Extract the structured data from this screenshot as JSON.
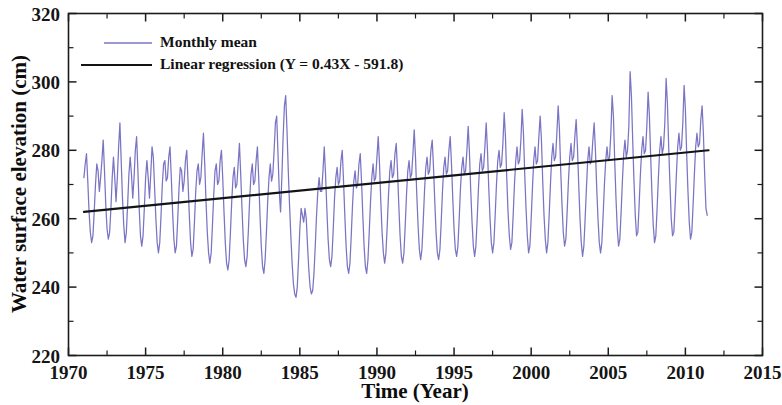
{
  "chart_data": {
    "type": "line",
    "title": "",
    "xlabel": "Time (Year)",
    "ylabel": "Water surface elevation (cm)",
    "xlim": [
      1970,
      2015
    ],
    "ylim": [
      220,
      320
    ],
    "x_major_ticks": [
      1970,
      1975,
      1980,
      1985,
      1990,
      1995,
      2000,
      2005,
      2010,
      2015
    ],
    "x_minor_interval": 2.5,
    "y_major_ticks": [
      220,
      240,
      260,
      280,
      300,
      320
    ],
    "y_minor_interval": 10,
    "grid": false,
    "legend_position": "top-left",
    "series": [
      {
        "name": "Monthly mean",
        "color": "#7a74c4",
        "style": "line",
        "x_start": 1971.0,
        "x_end": 2011.5,
        "x_step": 0.0833333,
        "values": [
          272,
          276,
          279,
          271,
          262,
          256,
          253,
          255,
          262,
          270,
          276,
          274,
          268,
          272,
          277,
          283,
          274,
          264,
          257,
          254,
          256,
          263,
          272,
          278,
          272,
          265,
          272,
          281,
          288,
          277,
          266,
          258,
          253,
          256,
          264,
          273,
          278,
          273,
          266,
          272,
          280,
          284,
          274,
          263,
          255,
          252,
          255,
          263,
          272,
          277,
          272,
          266,
          273,
          281,
          278,
          269,
          260,
          253,
          250,
          253,
          261,
          270,
          276,
          277,
          271,
          272,
          278,
          281,
          272,
          262,
          254,
          250,
          252,
          260,
          269,
          275,
          274,
          268,
          271,
          277,
          280,
          271,
          261,
          253,
          249,
          251,
          259,
          268,
          274,
          276,
          270,
          272,
          279,
          285,
          276,
          265,
          256,
          250,
          247,
          250,
          258,
          267,
          274,
          276,
          270,
          271,
          277,
          280,
          272,
          262,
          253,
          247,
          245,
          248,
          256,
          265,
          272,
          275,
          269,
          270,
          276,
          282,
          273,
          263,
          254,
          248,
          246,
          249,
          257,
          266,
          273,
          276,
          270,
          271,
          277,
          281,
          272,
          261,
          252,
          246,
          244,
          248,
          256,
          265,
          272,
          276,
          271,
          273,
          280,
          288,
          290,
          279,
          268,
          262,
          272,
          284,
          293,
          296,
          286,
          274,
          264,
          255,
          247,
          241,
          238,
          237,
          240,
          248,
          257,
          263,
          261,
          259,
          263,
          260,
          252,
          245,
          240,
          238,
          239,
          244,
          252,
          261,
          268,
          272,
          268,
          268,
          274,
          281,
          273,
          263,
          254,
          248,
          246,
          249,
          257,
          266,
          272,
          275,
          270,
          271,
          277,
          280,
          271,
          261,
          252,
          246,
          244,
          247,
          255,
          264,
          271,
          274,
          269,
          270,
          276,
          279,
          271,
          261,
          252,
          246,
          244,
          248,
          256,
          265,
          272,
          276,
          271,
          272,
          278,
          284,
          276,
          265,
          256,
          250,
          247,
          250,
          258,
          267,
          274,
          277,
          272,
          273,
          279,
          282,
          274,
          264,
          255,
          249,
          247,
          250,
          258,
          267,
          274,
          277,
          272,
          273,
          279,
          286,
          278,
          267,
          258,
          251,
          248,
          251,
          259,
          268,
          275,
          278,
          273,
          274,
          280,
          283,
          275,
          265,
          256,
          250,
          248,
          251,
          259,
          268,
          275,
          278,
          273,
          274,
          280,
          284,
          276,
          266,
          257,
          251,
          249,
          252,
          260,
          269,
          275,
          278,
          273,
          274,
          280,
          287,
          279,
          268,
          259,
          252,
          249,
          252,
          260,
          269,
          276,
          279,
          274,
          275,
          281,
          288,
          280,
          269,
          260,
          253,
          250,
          253,
          261,
          270,
          277,
          280,
          275,
          276,
          282,
          291,
          284,
          272,
          262,
          255,
          251,
          253,
          261,
          270,
          277,
          281,
          276,
          277,
          283,
          292,
          285,
          273,
          263,
          255,
          250,
          252,
          260,
          269,
          277,
          281,
          276,
          277,
          284,
          290,
          283,
          271,
          261,
          254,
          250,
          253,
          261,
          270,
          278,
          282,
          277,
          278,
          285,
          293,
          286,
          274,
          264,
          256,
          252,
          254,
          262,
          271,
          278,
          282,
          277,
          278,
          284,
          289,
          281,
          270,
          260,
          253,
          249,
          252,
          260,
          269,
          277,
          281,
          276,
          277,
          283,
          288,
          280,
          269,
          260,
          253,
          250,
          253,
          261,
          270,
          277,
          281,
          277,
          278,
          285,
          296,
          290,
          277,
          266,
          257,
          252,
          254,
          262,
          271,
          279,
          283,
          278,
          280,
          287,
          303,
          296,
          283,
          271,
          261,
          255,
          256,
          264,
          273,
          280,
          284,
          279,
          280,
          287,
          297,
          290,
          278,
          267,
          258,
          253,
          255,
          263,
          272,
          280,
          284,
          279,
          281,
          288,
          301,
          294,
          281,
          270,
          260,
          255,
          256,
          264,
          273,
          281,
          285,
          280,
          281,
          288,
          299,
          292,
          279,
          268,
          259,
          254,
          256,
          264,
          273,
          281,
          285,
          281,
          282,
          289,
          293,
          285,
          273,
          263,
          261
        ]
      },
      {
        "name": "Linear regression (Y = 0.43X - 591.8)",
        "color": "#141414",
        "style": "line",
        "slope": 0.43,
        "intercept": -591.8,
        "equation": "Y = 0.43X - 591.8",
        "x_start": 1971.0,
        "x_end": 2011.5,
        "y_start": 262.0,
        "y_end": 280.0
      }
    ]
  },
  "legend": {
    "entries": [
      {
        "label": "Monthly mean",
        "color": "#7a74c4"
      },
      {
        "label": "Linear regression (Y = 0.43X - 591.8)",
        "color": "#141414"
      }
    ]
  },
  "axes": {
    "x_title": "Time (Year)",
    "y_title": "Water surface elevation (cm)",
    "x_tick_labels": [
      "1970",
      "1975",
      "1980",
      "1985",
      "1990",
      "1995",
      "2000",
      "2005",
      "2010",
      "2015"
    ],
    "y_tick_labels": [
      "220",
      "240",
      "260",
      "280",
      "300",
      "320"
    ]
  }
}
